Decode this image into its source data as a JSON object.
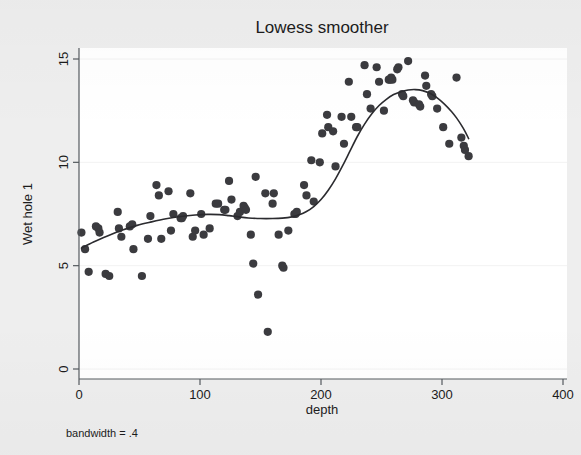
{
  "figure": {
    "background_color": "#eeeeee",
    "plot_background_color": "#ffffff",
    "note": "bandwidth = .4"
  },
  "chart_data": {
    "type": "scatter",
    "title": "Lowess smoother",
    "xlabel": "depth",
    "ylabel": "Wet hole 1",
    "xlim": [
      0,
      405
    ],
    "ylim": [
      0,
      15.6
    ],
    "xticks": [
      0,
      100,
      200,
      300,
      400
    ],
    "yticks": [
      0,
      5,
      10,
      15
    ],
    "xtick_labels": [
      "0",
      "100",
      "200",
      "300",
      "400"
    ],
    "ytick_labels": [
      "0",
      "5",
      "10",
      "15"
    ],
    "grid": "horizontal",
    "legend": "none",
    "annotation": "bandwidth = .4",
    "point_color": "#3b3b3f",
    "line_color": "#2b2b2f",
    "series": [
      {
        "name": "Wet hole 1 observations",
        "type": "scatter",
        "points": [
          [
            2,
            6.6
          ],
          [
            5,
            5.8
          ],
          [
            8,
            4.7
          ],
          [
            14,
            6.9
          ],
          [
            16,
            6.8
          ],
          [
            17,
            6.6
          ],
          [
            22,
            4.6
          ],
          [
            25,
            4.5
          ],
          [
            32,
            7.6
          ],
          [
            33,
            6.8
          ],
          [
            35,
            6.4
          ],
          [
            42,
            6.9
          ],
          [
            44,
            7.0
          ],
          [
            45,
            5.8
          ],
          [
            52,
            4.5
          ],
          [
            57,
            6.3
          ],
          [
            59,
            7.4
          ],
          [
            64,
            8.9
          ],
          [
            66,
            8.4
          ],
          [
            68,
            6.3
          ],
          [
            74,
            8.6
          ],
          [
            76,
            6.7
          ],
          [
            78,
            7.5
          ],
          [
            84,
            7.3
          ],
          [
            85,
            7.3
          ],
          [
            86,
            7.4
          ],
          [
            92,
            8.5
          ],
          [
            94,
            6.4
          ],
          [
            96,
            6.7
          ],
          [
            101,
            7.5
          ],
          [
            103,
            6.5
          ],
          [
            108,
            6.8
          ],
          [
            113,
            8.0
          ],
          [
            115,
            8.0
          ],
          [
            120,
            7.7
          ],
          [
            121,
            7.7
          ],
          [
            124,
            9.1
          ],
          [
            126,
            8.2
          ],
          [
            131,
            7.4
          ],
          [
            133,
            7.6
          ],
          [
            136,
            7.9
          ],
          [
            137,
            7.8
          ],
          [
            138,
            7.7
          ],
          [
            142,
            6.5
          ],
          [
            144,
            5.1
          ],
          [
            146,
            9.3
          ],
          [
            148,
            3.6
          ],
          [
            154,
            8.5
          ],
          [
            156,
            1.8
          ],
          [
            160,
            8.0
          ],
          [
            161,
            8.5
          ],
          [
            165,
            6.5
          ],
          [
            168,
            5.0
          ],
          [
            169,
            4.9
          ],
          [
            173,
            6.7
          ],
          [
            178,
            7.5
          ],
          [
            179,
            7.5
          ],
          [
            180,
            7.6
          ],
          [
            186,
            8.9
          ],
          [
            188,
            8.4
          ],
          [
            192,
            10.1
          ],
          [
            194,
            8.1
          ],
          [
            199,
            10.0
          ],
          [
            201,
            11.4
          ],
          [
            205,
            12.3
          ],
          [
            206,
            11.7
          ],
          [
            210,
            11.5
          ],
          [
            212,
            9.8
          ],
          [
            217,
            12.2
          ],
          [
            219,
            10.9
          ],
          [
            223,
            13.9
          ],
          [
            225,
            12.2
          ],
          [
            229,
            11.7
          ],
          [
            230,
            11.7
          ],
          [
            236,
            14.7
          ],
          [
            238,
            13.3
          ],
          [
            241,
            12.6
          ],
          [
            246,
            14.6
          ],
          [
            248,
            13.9
          ],
          [
            252,
            12.5
          ],
          [
            256,
            14.0
          ],
          [
            257,
            14.0
          ],
          [
            258,
            14.1
          ],
          [
            259,
            14.0
          ],
          [
            263,
            14.5
          ],
          [
            264,
            14.6
          ],
          [
            267,
            13.3
          ],
          [
            268,
            13.2
          ],
          [
            272,
            14.9
          ],
          [
            276,
            13.0
          ],
          [
            277,
            12.9
          ],
          [
            281,
            12.8
          ],
          [
            282,
            12.7
          ],
          [
            286,
            14.2
          ],
          [
            287,
            13.7
          ],
          [
            291,
            13.3
          ],
          [
            292,
            13.2
          ],
          [
            296,
            12.6
          ],
          [
            301,
            11.7
          ],
          [
            306,
            10.9
          ],
          [
            312,
            14.1
          ],
          [
            316,
            11.2
          ],
          [
            318,
            10.8
          ],
          [
            319,
            10.6
          ],
          [
            322,
            10.3
          ]
        ]
      },
      {
        "name": "Lowess smooth",
        "type": "line",
        "points": [
          [
            2,
            5.85
          ],
          [
            12,
            6.15
          ],
          [
            24,
            6.45
          ],
          [
            36,
            6.72
          ],
          [
            48,
            6.95
          ],
          [
            60,
            7.12
          ],
          [
            72,
            7.27
          ],
          [
            84,
            7.38
          ],
          [
            96,
            7.45
          ],
          [
            106,
            7.48
          ],
          [
            116,
            7.47
          ],
          [
            124,
            7.42
          ],
          [
            132,
            7.36
          ],
          [
            140,
            7.31
          ],
          [
            150,
            7.28
          ],
          [
            160,
            7.28
          ],
          [
            168,
            7.3
          ],
          [
            176,
            7.36
          ],
          [
            182,
            7.46
          ],
          [
            188,
            7.62
          ],
          [
            194,
            7.86
          ],
          [
            200,
            8.2
          ],
          [
            206,
            8.65
          ],
          [
            212,
            9.2
          ],
          [
            218,
            9.85
          ],
          [
            224,
            10.55
          ],
          [
            230,
            11.25
          ],
          [
            236,
            11.85
          ],
          [
            242,
            12.35
          ],
          [
            248,
            12.75
          ],
          [
            254,
            13.05
          ],
          [
            260,
            13.28
          ],
          [
            266,
            13.42
          ],
          [
            272,
            13.5
          ],
          [
            278,
            13.52
          ],
          [
            284,
            13.47
          ],
          [
            290,
            13.34
          ],
          [
            296,
            13.12
          ],
          [
            302,
            12.82
          ],
          [
            308,
            12.45
          ],
          [
            312,
            12.15
          ],
          [
            316,
            11.8
          ],
          [
            319,
            11.5
          ],
          [
            322,
            11.15
          ]
        ]
      }
    ]
  }
}
